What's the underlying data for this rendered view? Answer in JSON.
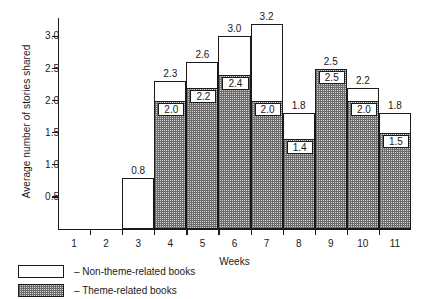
{
  "chart_data": {
    "type": "bar",
    "title": "",
    "subtitle": "",
    "xlabel": "Weeks",
    "ylabel": "Average number of stories shared",
    "categories": [
      "1",
      "2",
      "3",
      "4",
      "5",
      "6",
      "7",
      "8",
      "9",
      "10",
      "11"
    ],
    "ylim": [
      0,
      3.25
    ],
    "yticks": [
      0.5,
      1.0,
      1.5,
      2.0,
      2.5,
      3.0
    ],
    "ytick_labels": [
      "0.5",
      "1.0",
      "1.5",
      "2.0",
      "2.5",
      "3.0"
    ],
    "grid": false,
    "stacked": true,
    "legend_position": "below-left",
    "series": [
      {
        "name": "Theme-related books",
        "fill": "hatch-gray",
        "values": [
          null,
          null,
          null,
          2.0,
          2.2,
          2.4,
          2.0,
          1.4,
          2.5,
          2.0,
          1.5
        ],
        "labels": [
          "",
          "",
          "",
          "2.0",
          "2.2",
          "2.4",
          "2.0",
          "1.4",
          "2.5",
          "2.0",
          "1.5"
        ]
      },
      {
        "name": "Non-theme-related books",
        "fill": "white",
        "values": [
          null,
          null,
          0.8,
          0.3,
          0.4,
          0.6,
          1.2,
          0.4,
          0.0,
          0.2,
          0.3
        ],
        "totals": [
          null,
          null,
          0.8,
          2.3,
          2.6,
          3.0,
          3.2,
          1.8,
          2.5,
          2.2,
          1.8
        ],
        "total_labels": [
          "",
          "",
          "0.8",
          "2.3",
          "2.6",
          "3.0",
          "3.2",
          "1.8",
          "2.5",
          "2.2",
          "1.8"
        ]
      }
    ],
    "legend": [
      {
        "label": "– Non-theme-related books",
        "swatch": "white"
      },
      {
        "label": "– Theme-related books",
        "swatch": "hatch-gray"
      }
    ],
    "colors": {
      "axis": "#1a1a1a",
      "bar_outline": "#1a1a1a",
      "theme_fill": "#cfcfcf",
      "nontheme_fill": "#ffffff",
      "background": "#ffffff"
    }
  }
}
